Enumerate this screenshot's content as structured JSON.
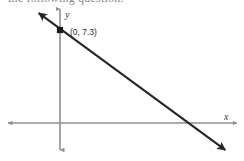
{
  "figure": {
    "partial_top_text": "the following question.",
    "width": 244,
    "height": 161,
    "background_color": "#ffffff"
  },
  "axes": {
    "x_axis_label": "x",
    "y_axis_label": "y",
    "axis_color": "#8f8f8f",
    "origin_px": {
      "x": 60,
      "y": 123
    },
    "x_axis_extent_px": {
      "x1": 6,
      "x2": 239
    },
    "y_axis_extent_px": {
      "y1": 7,
      "y2": 152
    }
  },
  "annotations": {
    "point_label": "(0, 7.3)",
    "point_label_px": {
      "x": 70,
      "y": 32
    },
    "point_marker_px": {
      "x": 60,
      "y": 30
    },
    "point_color": "#1a1a1a"
  },
  "chart_data": {
    "type": "line",
    "title": "",
    "subtitle": "",
    "xlabel": "x",
    "ylabel": "y",
    "grid": false,
    "legend_position": "none",
    "axis_arrows": "both-ends",
    "series": [
      {
        "name": "linear function",
        "kind": "line",
        "description": "Descending straight line with double arrowheads crossing the y-axis at (0, 7.3) and crossing the x-axis in the positive x region",
        "y_intercept": 7.3,
        "labeled_points": [
          {
            "label": "(0, 7.3)",
            "x": 0,
            "y": 7.3
          }
        ],
        "endpoints_px": [
          {
            "x": 36,
            "y": 11
          },
          {
            "x": 228,
            "y": 152
          }
        ],
        "color": "#262626"
      }
    ],
    "xlim": [
      -5.8,
      19.1
    ],
    "ylim": [
      -3.0,
      12.2
    ],
    "tick_labels_x": [],
    "tick_labels_y": []
  }
}
